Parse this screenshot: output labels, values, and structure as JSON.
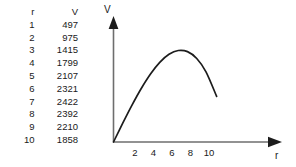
{
  "table": {
    "headers": [
      "r",
      "V"
    ],
    "rows": [
      [
        "1",
        "497"
      ],
      [
        "2",
        "975"
      ],
      [
        "3",
        "1415"
      ],
      [
        "4",
        "1799"
      ],
      [
        "5",
        "2107"
      ],
      [
        "6",
        "2321"
      ],
      [
        "7",
        "2422"
      ],
      [
        "8",
        "2392"
      ],
      [
        "9",
        "2210"
      ],
      [
        "10",
        "1858"
      ]
    ]
  },
  "chart_data": {
    "type": "line",
    "title": "",
    "xlabel": "r",
    "ylabel": "V",
    "x": [
      1,
      2,
      3,
      4,
      5,
      6,
      7,
      8,
      9,
      10
    ],
    "values": [
      497,
      975,
      1415,
      1799,
      2107,
      2321,
      2422,
      2392,
      2210,
      1858
    ],
    "series": [
      {
        "name": "V",
        "values": [
          497,
          975,
          1415,
          1799,
          2107,
          2321,
          2422,
          2392,
          2210,
          1858
        ]
      }
    ],
    "xtick_labels": [
      "2",
      "4",
      "6",
      "8",
      "10"
    ],
    "xtick_values": [
      2,
      4,
      6,
      8,
      10
    ],
    "ytick_labels": [],
    "xlim": [
      0,
      13
    ],
    "ylim": [
      0,
      2700
    ],
    "grid": false,
    "legend": false,
    "axis_arrows": true,
    "curve_color": "#1c1c1c",
    "axis_color": "#6e6e6e"
  }
}
